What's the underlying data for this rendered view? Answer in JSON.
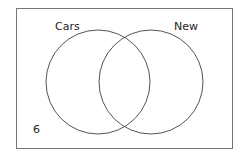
{
  "diagram": {
    "type": "venn",
    "sets": [
      {
        "label": "Cars"
      },
      {
        "label": "New"
      }
    ],
    "outside_value": "6"
  },
  "colors": {
    "stroke": "#555555",
    "text": "#222222"
  }
}
